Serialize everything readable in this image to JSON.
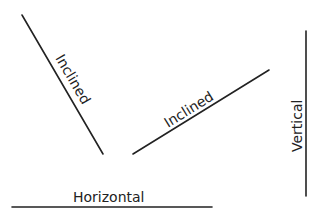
{
  "diagram": {
    "stroke_color": "#222222",
    "background": "#ffffff",
    "lines": [
      {
        "id": "inclined-left",
        "label": "Inclined",
        "x1": 22,
        "y1": 15,
        "x2": 103,
        "y2": 154
      },
      {
        "id": "inclined-middle",
        "label": "Inclined",
        "x1": 133,
        "y1": 154,
        "x2": 269,
        "y2": 70
      },
      {
        "id": "vertical",
        "label": "Vertical",
        "x1": 306,
        "y1": 31,
        "x2": 306,
        "y2": 196
      },
      {
        "id": "horizontal",
        "label": "Horizontal",
        "x1": 12,
        "y1": 207,
        "x2": 212,
        "y2": 207
      }
    ]
  }
}
